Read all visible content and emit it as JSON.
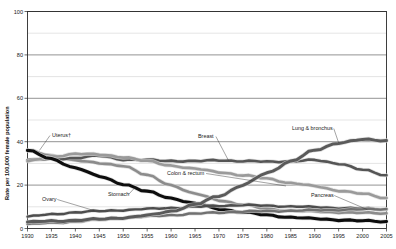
{
  "chart_data": {
    "type": "line",
    "title": "",
    "xlabel": "",
    "ylabel": "Rate per 100,000 female population",
    "xlim": [
      1930,
      2005
    ],
    "ylim": [
      0,
      100
    ],
    "grid": "horizontal gridlines every 10 units; labeled major gridlines every 20",
    "legend_position": "inline annotations on curves",
    "ytick_labels": [
      "0",
      "20",
      "40",
      "60",
      "80",
      "100"
    ],
    "ytick_values": [
      0,
      20,
      40,
      60,
      80,
      100
    ],
    "xtick_labels": [
      "1930",
      "1935",
      "1940",
      "1945",
      "1950",
      "1955",
      "1960",
      "1965",
      "1970",
      "1975",
      "1980",
      "1985",
      "1990",
      "1995",
      "2000",
      "2005"
    ],
    "xtick_values": [
      1930,
      1935,
      1940,
      1945,
      1950,
      1955,
      1960,
      1965,
      1970,
      1975,
      1980,
      1985,
      1990,
      1995,
      2000,
      2005
    ],
    "x": [
      1930,
      1935,
      1940,
      1945,
      1950,
      1955,
      1960,
      1965,
      1970,
      1975,
      1980,
      1985,
      1990,
      1995,
      2000,
      2005
    ],
    "series": [
      {
        "name": "Uterus",
        "label": "Uterus†",
        "color": "#8c8c8c",
        "width": 2.6,
        "label_x": 52,
        "label_y": 137,
        "values": [
          36.0,
          33.5,
          31.5,
          30.0,
          29.0,
          24.5,
          20.0,
          16.0,
          13.0,
          11.0,
          9.0,
          8.2,
          7.8,
          7.5,
          7.2,
          7.0
        ]
      },
      {
        "name": "Breast",
        "label": "Breast",
        "color": "#555555",
        "width": 2.6,
        "label_x": 198,
        "label_y": 138,
        "values": [
          31.5,
          32.0,
          32.5,
          33.5,
          31.8,
          31.5,
          31.2,
          31.0,
          31.5,
          31.0,
          30.8,
          31.0,
          31.5,
          30.0,
          27.0,
          24.5
        ]
      },
      {
        "name": "Colon & rectum",
        "label": "Colon & rectum",
        "color": "#9a9a9a",
        "width": 2.6,
        "label_x": 167,
        "label_y": 175,
        "values": [
          31.0,
          33.0,
          34.5,
          34.0,
          33.0,
          31.0,
          29.0,
          27.5,
          26.0,
          24.5,
          23.0,
          21.0,
          19.5,
          17.5,
          16.0,
          14.0
        ]
      },
      {
        "name": "Stomach",
        "label": "Stomach",
        "color": "#0d0d0d",
        "width": 3.1,
        "label_x": 108,
        "label_y": 196,
        "values": [
          36.0,
          32.0,
          28.0,
          24.0,
          20.5,
          17.0,
          14.0,
          11.5,
          9.0,
          7.5,
          6.2,
          5.2,
          4.5,
          4.0,
          3.5,
          3.2
        ]
      },
      {
        "name": "Ovary",
        "label": "Ovary",
        "color": "#4d4d4d",
        "width": 2.4,
        "label_x": 42,
        "label_y": 201,
        "values": [
          5.5,
          6.5,
          7.5,
          8.0,
          8.5,
          9.0,
          9.5,
          10.0,
          10.5,
          10.8,
          10.5,
          10.2,
          9.8,
          9.5,
          9.2,
          8.8
        ]
      },
      {
        "name": "Pancreas",
        "label": "Pancreas",
        "color": "#707070",
        "width": 2.4,
        "label_x": 311,
        "label_y": 197,
        "values": [
          2.0,
          2.6,
          3.2,
          4.0,
          4.8,
          5.5,
          6.2,
          6.8,
          7.4,
          7.8,
          8.0,
          8.2,
          8.4,
          8.6,
          8.8,
          9.0
        ]
      },
      {
        "name": "Lung & bronchus",
        "label": "Lung & bronchus",
        "color": "#5a5a5a",
        "width": 3.0,
        "label_x": 292,
        "label_y": 130,
        "values": [
          3.0,
          3.4,
          3.8,
          4.3,
          5.0,
          6.0,
          8.0,
          11.0,
          15.0,
          20.0,
          25.5,
          31.0,
          36.0,
          39.5,
          41.0,
          40.5
        ]
      }
    ],
    "annotations": [
      {
        "text": "Uterus†",
        "note": "leader line down-right to uterus curve near 1932"
      },
      {
        "text": "Breast",
        "note": "leader line to breast curve near 1972"
      },
      {
        "text": "Colon & rectum",
        "note": "leader line right to colon curve near 1982"
      },
      {
        "text": "Stomach",
        "note": "leader line right to stomach curve near 1952"
      },
      {
        "text": "Ovary",
        "note": "leader line right to ovary curve near 1942"
      },
      {
        "text": "Pancreas",
        "note": "leader line right-down to pancreas curve near 2000"
      },
      {
        "text": "Lung & bronchus",
        "note": "leader line right-down to lung curve near 1994"
      }
    ]
  },
  "figure": {
    "background": "#ffffff",
    "plot_frame_color": "#2b2b2b"
  }
}
